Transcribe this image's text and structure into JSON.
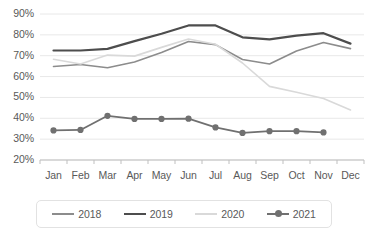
{
  "chart_data": {
    "type": "line",
    "title": "",
    "subtitle": "",
    "xlabel": "",
    "ylabel": "",
    "categories": [
      "Jan",
      "Feb",
      "Mar",
      "Apr",
      "May",
      "Jun",
      "Jul",
      "Aug",
      "Sep",
      "Oct",
      "Nov",
      "Dec"
    ],
    "ylim": [
      20,
      90
    ],
    "ytick_labels": [
      "20%",
      "30%",
      "40%",
      "50%",
      "60%",
      "70%",
      "80%",
      "90%"
    ],
    "ytick_values": [
      20,
      30,
      40,
      50,
      60,
      70,
      80,
      90
    ],
    "grid": true,
    "legend_position": "bottom",
    "series": [
      {
        "name": "2018",
        "color": "#8c8c8c",
        "width": 1.6,
        "marker": false,
        "values": [
          64.8,
          65.8,
          64.2,
          67.0,
          71.5,
          76.8,
          75.3,
          68.2,
          66.0,
          72.3,
          76.3,
          73.4
        ]
      },
      {
        "name": "2019",
        "color": "#4d4d4d",
        "width": 2.2,
        "marker": false,
        "values": [
          72.5,
          72.5,
          73.3,
          77.0,
          80.5,
          84.5,
          84.5,
          78.8,
          77.8,
          79.6,
          80.8,
          75.8
        ]
      },
      {
        "name": "2020",
        "color": "#d9d9d9",
        "width": 1.6,
        "marker": false,
        "values": [
          68.3,
          66.0,
          70.3,
          69.8,
          74.0,
          78.0,
          75.5,
          66.5,
          55.3,
          52.5,
          49.5,
          44.0
        ]
      },
      {
        "name": "2021",
        "color": "#707070",
        "width": 1.8,
        "marker": true,
        "values": [
          34.2,
          34.4,
          41.2,
          39.7,
          39.7,
          39.8,
          35.6,
          33.0,
          33.8,
          33.8,
          33.2,
          null
        ]
      }
    ]
  },
  "legend": {
    "items": [
      {
        "label": "2018",
        "color": "#8c8c8c",
        "marker": false
      },
      {
        "label": "2019",
        "color": "#4d4d4d",
        "marker": false
      },
      {
        "label": "2020",
        "color": "#d9d9d9",
        "marker": false
      },
      {
        "label": "2021",
        "color": "#707070",
        "marker": true
      }
    ]
  },
  "colors": {
    "grid": "#e8e8e8",
    "axis": "#bfbfbf",
    "tick_text": "#595959",
    "background": "#ffffff",
    "legend_border": "#e2e2e2"
  }
}
